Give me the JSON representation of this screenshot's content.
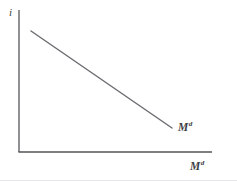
{
  "figure": {
    "background_color": "#ffffff",
    "axis_color": "#555558",
    "curve_color": "#6a6a70",
    "text_color": "#3d3d42",
    "divider_color": "#e8e8ec"
  },
  "labels": {
    "y_axis": "i",
    "x_axis_base": "M",
    "x_axis_sup": "d",
    "curve_base": "M",
    "curve_sup": "d"
  },
  "chart_data": {
    "type": "line",
    "title": "",
    "subtitle": "",
    "xlabel": "Md",
    "ylabel": "i",
    "grid": false,
    "legend": "none",
    "annotations": [
      {
        "text": "Md",
        "target": "money-demand-curve",
        "position": "curve-end-right"
      }
    ],
    "axes": {
      "x": {
        "show_ticks": false,
        "tick_labels": [],
        "range_px": [
          19,
          212
        ],
        "arrow": false
      },
      "y": {
        "show_ticks": false,
        "tick_labels": [],
        "range_px": [
          10,
          152
        ],
        "arrow": false
      }
    },
    "series": [
      {
        "name": "Md",
        "description": "Money demand curve, downward sloping",
        "x": [
          0.062,
          1.0
        ],
        "y": [
          1.0,
          0.317
        ],
        "points_px": [
          {
            "x": 31,
            "y": 31
          },
          {
            "x": 172,
            "y": 128
          }
        ],
        "slope": "negative",
        "color": "#6a6a70",
        "line_width": 1.4
      }
    ]
  }
}
